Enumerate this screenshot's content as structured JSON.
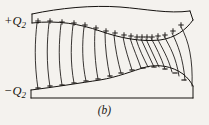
{
  "figure": {
    "caption": "(b)",
    "background_color": "#f4f2ee",
    "ink_color": "#15120f",
    "labels": {
      "top_conductor": {
        "sign": "+",
        "symbol": "Q",
        "subscript": "2"
      },
      "bottom_conductor": {
        "sign": "−",
        "symbol": "Q",
        "subscript": "2"
      }
    },
    "top_conductor": {
      "name": "positively-charged-conductor",
      "charge_marks": "+",
      "charge_mark_count": 18,
      "outline_top": "M 32,14 C 60,8 92,5 120,7 C 146,9 168,14 190,11",
      "outline_bottom": "M 32,23 C 58,20 80,24 100,31 C 120,38 140,42 160,40 C 175,38 186,30 193,20",
      "left_edge": "M 32,14 L 32,23",
      "right_edge": "M 190,11 L 193,20",
      "plus_positions": [
        [
          38,
          21
        ],
        [
          50,
          21
        ],
        [
          62,
          22
        ],
        [
          74,
          23
        ],
        [
          85,
          25
        ],
        [
          96,
          28
        ],
        [
          106,
          31
        ],
        [
          115,
          33
        ],
        [
          124,
          35
        ],
        [
          131,
          36
        ],
        [
          137,
          37
        ],
        [
          142,
          37
        ],
        [
          147,
          37
        ],
        [
          152,
          37
        ],
        [
          158,
          36
        ],
        [
          165,
          35
        ],
        [
          173,
          31
        ],
        [
          181,
          25
        ]
      ]
    },
    "bottom_conductor": {
      "name": "negatively-charged-conductor",
      "charge_marks": "−",
      "charge_mark_count": 14,
      "outline_top": "M 31,90 C 55,87 80,83 100,80 C 118,77 132,71 146,67 C 158,64 172,66 183,74 C 188,78 191,82 193,86",
      "outline_bottom": "M 31,98 L 193,98",
      "left_edge": "M 31,90 L 31,98",
      "right_edge": "M 193,86 L 193,98",
      "minus_positions": [
        [
          38,
          88
        ],
        [
          50,
          86
        ],
        [
          62,
          85
        ],
        [
          74,
          83
        ],
        [
          86,
          81
        ],
        [
          98,
          79
        ],
        [
          110,
          76
        ],
        [
          121,
          73
        ],
        [
          132,
          70
        ],
        [
          143,
          68
        ],
        [
          154,
          67
        ],
        [
          165,
          69
        ],
        [
          175,
          73
        ],
        [
          184,
          80
        ]
      ]
    },
    "field_lines": {
      "name": "electric-field-lines",
      "count": 18,
      "description": "curved lines running from the positive upper conductor to the negative lower conductor",
      "paths": [
        "M 37,23 C 35,40 34,62 38,89",
        "M 49,23 C 47,40 46,62 50,87",
        "M 61,24 C 59,41 58,62 62,85",
        "M 73,25 C 71,42 70,62 74,83",
        "M 84,27 C 82,43 82,63 86,81",
        "M 95,30 C 94,45 95,63 98,79",
        "M 105,33 C 105,47 107,63 110,77",
        "M 114,35 C 115,48 118,62 121,73",
        "M 123,37 C 125,49 129,60 132,70",
        "M 130,38 C 133,48 138,59 141,68",
        "M 136,39 C 139,49 144,59 148,67",
        "M 141,39 C 145,48 150,58 154,67",
        "M 146,39 C 150,48 155,58 159,67",
        "M 151,38 C 156,47 161,57 165,69",
        "M 157,38 C 162,48 168,57 172,72",
        "M 164,36 C 170,47 176,57 179,76",
        "M 172,33 C 178,45 183,58 185,80",
        "M 181,27 C 189,41 193,60 192,86"
      ]
    }
  }
}
